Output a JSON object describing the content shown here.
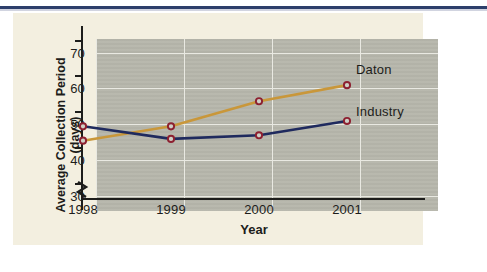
{
  "chart_data": {
    "type": "line",
    "title": "",
    "xlabel": "Year",
    "ylabel": "Average Collection Period (days)",
    "x": [
      "1998",
      "1999",
      "2000",
      "2001"
    ],
    "categories": [
      "1998",
      "1999",
      "2000",
      "2001"
    ],
    "series": [
      {
        "name": "Daton",
        "color": "#c9973a",
        "values": [
          42,
          46,
          53,
          57.5
        ]
      },
      {
        "name": "Industry",
        "color": "#1f2a5e",
        "values": [
          46,
          42.5,
          43.5,
          47.5
        ]
      }
    ],
    "ylim": [
      26,
      74
    ],
    "yticks": [
      30,
      40,
      50,
      60,
      70
    ],
    "ytick_labels": [
      "30",
      "40",
      "50",
      "60",
      "70"
    ],
    "axis_break": true,
    "grid": true,
    "legend_position": "right-inline",
    "marker": "open-circle",
    "marker_color": "#8d2030"
  },
  "axes": {
    "y_title": "Average Collection Period (days)",
    "x_title": "Year",
    "y_labels": [
      "70",
      "60",
      "50",
      "40",
      "30"
    ],
    "x_labels": [
      "1998",
      "1999",
      "2000",
      "2001"
    ]
  },
  "legend": {
    "daton": "Daton",
    "industry": "Industry"
  },
  "colors": {
    "daton_line": "#c9973a",
    "industry_line": "#1f2a5e",
    "marker_ring": "#8d2030",
    "plot_background": "#b6b6ab",
    "card_background": "#f3efe0",
    "gridline": "#e9e9e2",
    "axis": "#1d1d1b",
    "top_rule": "#2d3f6b"
  }
}
